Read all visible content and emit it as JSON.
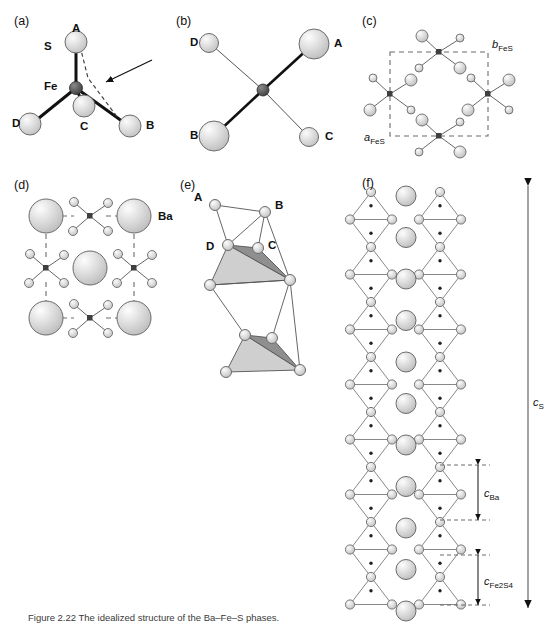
{
  "figure": {
    "width": 556,
    "height": 628,
    "caption": "Figure 2.22 The idealized structure of the Ba–Fe–S phases.",
    "panels": [
      {
        "id": "a",
        "label": "(a)",
        "x": 14,
        "y": 14
      },
      {
        "id": "b",
        "label": "(b)",
        "x": 176,
        "y": 14
      },
      {
        "id": "c",
        "label": "(c)",
        "x": 362,
        "y": 14
      },
      {
        "id": "d",
        "label": "(d)",
        "x": 14,
        "y": 178
      },
      {
        "id": "e",
        "label": "(e)",
        "x": 180,
        "y": 178
      },
      {
        "id": "f",
        "label": "(f)",
        "x": 362,
        "y": 176
      }
    ]
  },
  "panel_a": {
    "center_label": "Fe",
    "sulfur_label": "S",
    "vertex_labels": [
      "A",
      "B",
      "C",
      "D"
    ],
    "note": "tetrahedral FeS4 unit with dashed A-B edge indicated by arrow"
  },
  "panel_b": {
    "vertex_labels": [
      "A",
      "B",
      "C",
      "D"
    ],
    "note": "projection of FeS4 tetrahedron along chain axis"
  },
  "panel_c": {
    "param_a": "a",
    "param_a_sub": "FeS",
    "param_b": "b",
    "param_b_sub": "FeS",
    "note": "FeS sublattice unit cell, dashed outline"
  },
  "panel_d": {
    "ba_label": "Ba",
    "note": "Ba sublattice with FeS units at edge midpoints"
  },
  "panel_e": {
    "vertex_labels": [
      "A",
      "B",
      "C",
      "D"
    ],
    "note": "edge-sharing FeS4 tetrahedra chain"
  },
  "panel_f": {
    "param_cs": "c",
    "param_cs_sub": "S",
    "param_cba": "c",
    "param_cba_sub": "Ba",
    "param_cfes": "c",
    "param_cfes_sub": "Fe2S4",
    "note": "full chain structure with Ba column between two FeS4 chains"
  },
  "colors": {
    "sphere_fill": "#d9d9d9",
    "sphere_highlight": "#f2f2f2",
    "sphere_stroke": "#6b6b6b",
    "metal_fill": "#555555",
    "bond": "#111111",
    "thin_bond": "#7a7a7a",
    "dashed": "#6b6b6b",
    "tetra_light": "#cfcfcf",
    "tetra_dark": "#8f8f8f",
    "text": "#111111"
  }
}
